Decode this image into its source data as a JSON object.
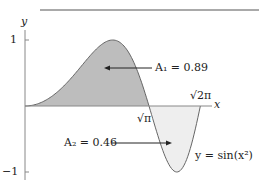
{
  "chart_data": {
    "type": "area",
    "title": "",
    "function": "y = sin(x^2)",
    "xlabel": "x",
    "ylabel": "y",
    "xlim": [
      0,
      2.6
    ],
    "ylim": [
      -1,
      1
    ],
    "y_ticks": [
      "1",
      "-1"
    ],
    "x_markers": [
      {
        "label": "√π",
        "value": 1.7725
      },
      {
        "label": "√2π",
        "value": 2.5066
      }
    ],
    "regions": [
      {
        "name": "A1",
        "label": "A₁ = 0.89",
        "value": 0.89,
        "x_range": [
          0,
          1.7725
        ],
        "fill": "#bdbdbd"
      },
      {
        "name": "A2",
        "label": "A₂ = 0.46",
        "value": 0.46,
        "x_range": [
          1.7725,
          2.5066
        ],
        "fill": "#eeeeee"
      }
    ],
    "curve_label": "y = sin(x²)",
    "grid": false
  },
  "labels": {
    "y_axis": "y",
    "x_axis": "x",
    "tick_pos1": "1",
    "tick_neg1": "−1",
    "sqrt_pi": "√π",
    "sqrt_2pi": "√2π",
    "a1": "A₁ = 0.89",
    "a2": "A₂ = 0.46",
    "curve": "y = sin(x²)"
  }
}
